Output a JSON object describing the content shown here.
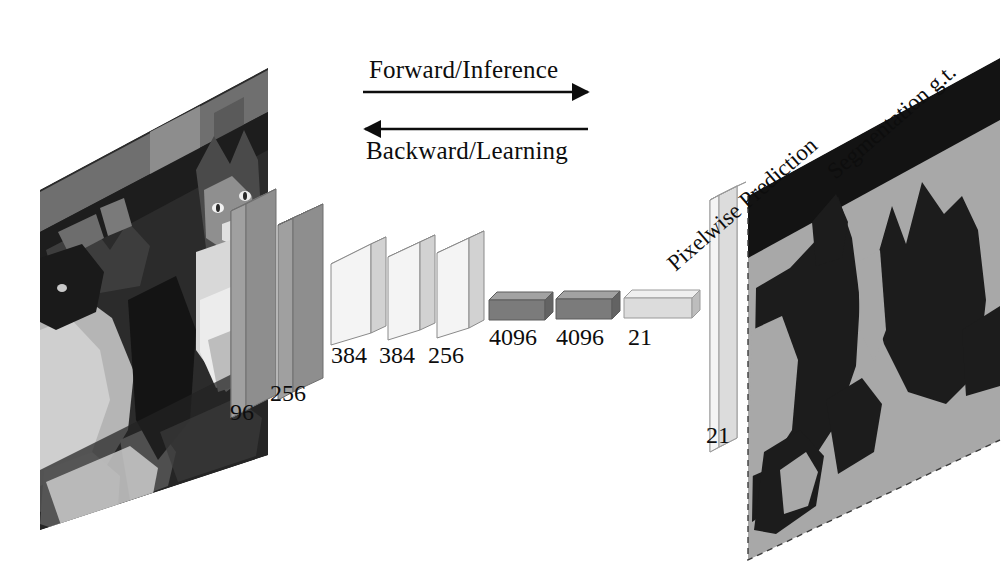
{
  "figure": {
    "name": "fcn-architecture-diagram",
    "background_color": "#ffffff"
  },
  "flow": {
    "forward_label": "Forward/Inference",
    "backward_label": "Backward/Learning",
    "forward_arrow": {
      "x1": 363,
      "y1": 92,
      "x2": 590,
      "y2": 92,
      "direction": "right"
    },
    "backward_arrow": {
      "x1": 363,
      "y1": 129,
      "x2": 590,
      "y2": 129,
      "direction": "left"
    }
  },
  "input": {
    "caption": "",
    "description": "grayscale photograph of a cat and a dog",
    "plane_fill": "#2a2a2a"
  },
  "layers": [
    {
      "id": "conv1",
      "label": "96",
      "kind": "conv",
      "face": "#9b9b9b",
      "top": "#b9b9b9",
      "side": "#7d7d7d"
    },
    {
      "id": "conv2",
      "label": "256",
      "kind": "conv",
      "face": "#9b9b9b",
      "top": "#b9b9b9",
      "side": "#7d7d7d"
    },
    {
      "id": "conv3",
      "label": "384",
      "kind": "conv",
      "face": "#f2f2f2",
      "top": "#ffffff",
      "side": "#d2d2d2"
    },
    {
      "id": "conv4",
      "label": "384",
      "kind": "conv",
      "face": "#f2f2f2",
      "top": "#ffffff",
      "side": "#d2d2d2"
    },
    {
      "id": "conv5",
      "label": "256",
      "kind": "conv",
      "face": "#f2f2f2",
      "top": "#ffffff",
      "side": "#d2d2d2"
    },
    {
      "id": "fc6",
      "label": "4096",
      "kind": "fc",
      "face": "#767676",
      "top": "#9d9d9d",
      "side": "#5e5e5e"
    },
    {
      "id": "fc7",
      "label": "4096",
      "kind": "fc",
      "face": "#767676",
      "top": "#9d9d9d",
      "side": "#5e5e5e"
    },
    {
      "id": "score",
      "label": "21",
      "kind": "fc",
      "face": "#d9d9d9",
      "top": "#efefef",
      "side": "#b4b4b4"
    }
  ],
  "output": {
    "prediction_label": "Pixelwise Prediction",
    "prediction_depth_label": "21",
    "groundtruth_label": "Segmentation g.t.",
    "prediction_plane_fill": "#e2e2e2",
    "groundtruth_plane_fill": "#a8a8a8",
    "groundtruth_band_fill": "#131313",
    "silhouette_fill": "#1c1c1c"
  },
  "colors": {
    "ink": "#0d0d0d",
    "paper": "#ffffff",
    "conv_dark": "#9b9b9b",
    "conv_light": "#f2f2f2",
    "fc_dark": "#767676",
    "fc_light": "#d9d9d9"
  }
}
